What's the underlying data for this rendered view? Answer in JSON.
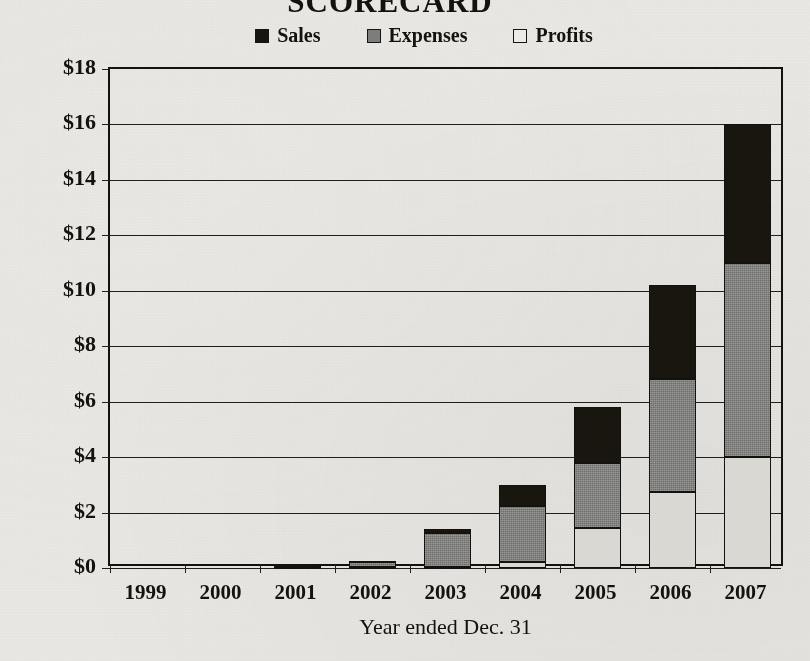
{
  "chart_data": {
    "type": "bar",
    "subtype": "stacked-bar",
    "title": "SCORECARD",
    "xlabel": "Year ended Dec. 31",
    "ylabel": "",
    "categories": [
      "1999",
      "2000",
      "2001",
      "2002",
      "2003",
      "2004",
      "2005",
      "2006",
      "2007"
    ],
    "series": [
      {
        "name": "Profits",
        "color": "#d9d8d3",
        "values": [
          0,
          0,
          0.0,
          0.02,
          0.05,
          0.2,
          1.45,
          2.75,
          4.0
        ]
      },
      {
        "name": "Expenses",
        "color": "#7e7e7c",
        "values": [
          0,
          0,
          0.05,
          0.18,
          1.2,
          2.05,
          2.35,
          4.05,
          7.0
        ]
      },
      {
        "name": "Sales",
        "color": "#18160f",
        "values": [
          0,
          0,
          0.02,
          0.07,
          0.15,
          0.75,
          2.0,
          3.4,
          5.0
        ]
      }
    ],
    "totals": [
      0,
      0.01,
      0.07,
      0.27,
      1.4,
      3.0,
      5.8,
      10.2,
      16.0
    ],
    "ylim": [
      0,
      18
    ],
    "ytick_step": 2,
    "yticks": [
      "$0",
      "$2",
      "$4",
      "$6",
      "$8",
      "$10",
      "$12",
      "$14",
      "$16",
      "$18"
    ],
    "ytick_values": [
      0,
      2,
      4,
      6,
      8,
      10,
      12,
      14,
      16,
      18
    ],
    "grid": true,
    "legend_position": "top-center",
    "legend": [
      "Sales",
      "Expenses",
      "Profits"
    ],
    "stack_order_bottom_to_top": [
      "Profits",
      "Expenses",
      "Sales"
    ],
    "value_prefix": "$",
    "units": "billions"
  },
  "legend_items": [
    {
      "label": "Sales",
      "swatch": "black-square-icon"
    },
    {
      "label": "Expenses",
      "swatch": "gray-square-icon"
    },
    {
      "label": "Profits",
      "swatch": "white-square-icon"
    }
  ]
}
